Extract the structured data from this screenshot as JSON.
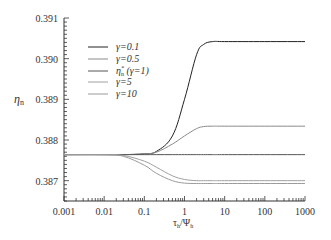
{
  "chart_data": {
    "type": "line",
    "title": "",
    "xlabel": "τ_h/Ψ_h",
    "ylabel": "η_n",
    "xscale": "log",
    "xlim": [
      0.001,
      1000
    ],
    "ylim": [
      0.3865,
      0.391
    ],
    "x_ticks": [
      "0.001",
      "0.01",
      "0.1",
      "1",
      "10",
      "100",
      "1000"
    ],
    "y_ticks": [
      "0.387",
      "0.388",
      "0.389",
      "0.390",
      "0.391"
    ],
    "grid": false,
    "legend_position": "upper-left",
    "x": [
      0.001,
      0.01,
      0.03,
      0.1,
      0.2,
      0.5,
      1,
      2,
      3,
      5,
      10,
      100,
      1000
    ],
    "series": [
      {
        "name": "γ=0.1",
        "color": "#222222",
        "values": [
          0.38764,
          0.38764,
          0.38764,
          0.38766,
          0.38772,
          0.3881,
          0.389,
          0.3901,
          0.39035,
          0.39042,
          0.39042,
          0.39042,
          0.39042
        ]
      },
      {
        "name": "γ=0.5",
        "color": "#8a8a8a",
        "values": [
          0.38764,
          0.38764,
          0.38764,
          0.38766,
          0.3877,
          0.3879,
          0.3881,
          0.38828,
          0.38833,
          0.38834,
          0.38834,
          0.38834,
          0.38834
        ]
      },
      {
        "name": "η*_n (γ=1)",
        "color": "#555555",
        "values": [
          0.38764,
          0.38764,
          0.38764,
          0.38764,
          0.38764,
          0.38764,
          0.38764,
          0.38764,
          0.38764,
          0.38764,
          0.38764,
          0.38764,
          0.38764
        ]
      },
      {
        "name": "γ=5",
        "color": "#a0a0a0",
        "values": [
          0.38764,
          0.38764,
          0.38762,
          0.38748,
          0.38733,
          0.38712,
          0.38703,
          0.387,
          0.387,
          0.387,
          0.387,
          0.387,
          0.387
        ]
      },
      {
        "name": "γ=10",
        "color": "#9a9a9a",
        "values": [
          0.38764,
          0.38764,
          0.3876,
          0.38738,
          0.38718,
          0.387,
          0.38694,
          0.38693,
          0.38693,
          0.38693,
          0.38693,
          0.38693,
          0.38693
        ]
      }
    ]
  },
  "axes": {
    "xlabel_main": "τ",
    "xlabel_sub1": "h",
    "xlabel_slash": "/Ψ",
    "xlabel_sub2": "h",
    "ylabel_main": "η",
    "ylabel_sub": "n"
  },
  "legend": {
    "items": [
      {
        "label": "γ=0.1"
      },
      {
        "label": "γ=0.5"
      },
      {
        "label_main": "η",
        "label_sup": "*",
        "label_sub": "n",
        "label_rest": " (γ=1)"
      },
      {
        "label": "γ=5"
      },
      {
        "label": "γ=10"
      }
    ]
  }
}
